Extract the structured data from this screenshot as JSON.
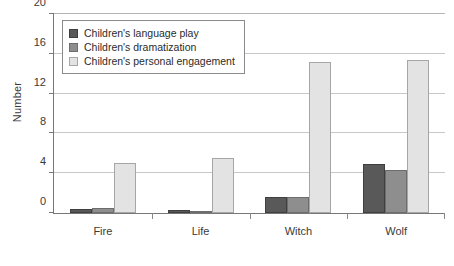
{
  "chart_data": {
    "type": "bar",
    "title": "",
    "xlabel": "",
    "ylabel": "Number",
    "categories": [
      "Fire",
      "Life",
      "Witch",
      "Wolf"
    ],
    "series": [
      {
        "name": "Children's language play",
        "values": [
          0.4,
          0.35,
          1.6,
          4.9
        ],
        "color": "#595959"
      },
      {
        "name": "Children's dramatization",
        "values": [
          0.5,
          0.1,
          1.6,
          4.3
        ],
        "color": "#8e8e8e"
      },
      {
        "name": "Children's personal engagement",
        "values": [
          5.0,
          5.5,
          15.2,
          15.4
        ],
        "color": "#e3e3e3"
      }
    ],
    "ylim": [
      0,
      20
    ],
    "yticks": [
      0,
      4,
      8,
      12,
      16,
      20
    ],
    "ytick_labels": [
      "0",
      "4",
      "8",
      "12",
      "16",
      "20"
    ],
    "grid": true,
    "legend_position": "upper left"
  }
}
